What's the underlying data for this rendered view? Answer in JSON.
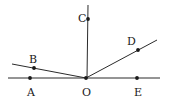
{
  "figure": {
    "background_color": "#ffffff",
    "line_color": "#2b2b2b",
    "point_color": "#1a1a1a",
    "width": 170,
    "height": 103
  },
  "labels": {
    "A": "A",
    "B": "B",
    "C": "C",
    "D": "D",
    "E": "E",
    "O": "O"
  },
  "chart_data": {
    "type": "scatter",
    "xlabel": "",
    "ylabel": "",
    "xlim": [
      0,
      170
    ],
    "ylim": [
      0,
      103
    ],
    "grid": false,
    "legend": "none",
    "points": [
      {
        "name": "A",
        "x": 30,
        "y": 78,
        "label": "A",
        "label_x": 27,
        "label_y": 87
      },
      {
        "name": "B",
        "x": 34,
        "y": 68,
        "label": "B",
        "label_x": 29,
        "label_y": 54
      },
      {
        "name": "C",
        "x": 88,
        "y": 19,
        "label": "C",
        "label_x": 78,
        "label_y": 13
      },
      {
        "name": "D",
        "x": 138,
        "y": 50,
        "label": "D",
        "label_x": 127,
        "label_y": 36
      },
      {
        "name": "E",
        "x": 137,
        "y": 78,
        "label": "E",
        "label_x": 134,
        "label_y": 87
      },
      {
        "name": "O",
        "x": 86,
        "y": 78,
        "label": "O",
        "label_x": 82,
        "label_y": 87
      }
    ],
    "segments": [
      {
        "name": "horizontal-line-AOE",
        "x1": 8,
        "y1": 78,
        "x2": 160,
        "y2": 78
      },
      {
        "name": "vertical-ray-OC",
        "x1": 88,
        "y1": 5,
        "x2": 87,
        "y2": 78
      },
      {
        "name": "ray-OB",
        "x1": 86,
        "y1": 78,
        "x2": 12,
        "y2": 64
      },
      {
        "name": "ray-OD",
        "x1": 86,
        "y1": 78,
        "x2": 157,
        "y2": 40
      }
    ],
    "dot_radius": 1.9
  }
}
